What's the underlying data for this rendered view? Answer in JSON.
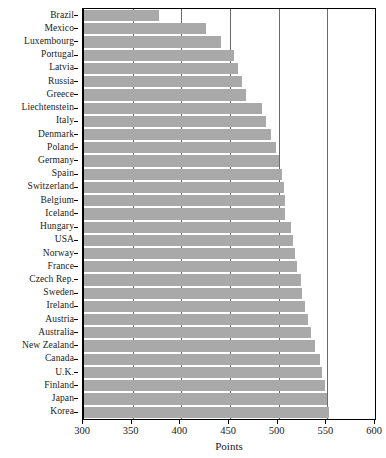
{
  "chart_data": {
    "type": "bar",
    "orientation": "horizontal",
    "title": "",
    "xlabel": "Points",
    "ylabel": "",
    "xlim": [
      300,
      600
    ],
    "xticks": [
      300,
      350,
      400,
      450,
      500,
      550,
      600
    ],
    "grid": "vertical",
    "legend": "none",
    "bar_color": "#a9a9a9",
    "categories": [
      "Brazil",
      "Mexico",
      "Luxembourg",
      "Portugal",
      "Latvia",
      "Russia",
      "Greece",
      "Liechtenstein",
      "Italy",
      "Denmark",
      "Poland",
      "Germany",
      "Spain",
      "Switzerland",
      "Belgium",
      "Iceland",
      "Hungary",
      "USA",
      "Norway",
      "France",
      "Czech Rep.",
      "Sweden",
      "Ireland",
      "Austria",
      "Australia",
      "New Zealand",
      "Canada",
      "U.K.",
      "Finland",
      "Japan",
      "Korea"
    ],
    "values": [
      377,
      425,
      441,
      454,
      458,
      462,
      466,
      483,
      487,
      492,
      497,
      500,
      503,
      505,
      507,
      507,
      513,
      515,
      517,
      519,
      523,
      524,
      527,
      530,
      533,
      537,
      542,
      545,
      548,
      550,
      552
    ]
  }
}
